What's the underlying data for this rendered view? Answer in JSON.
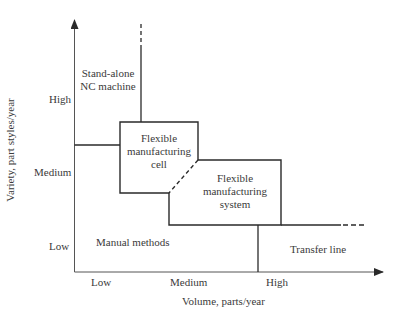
{
  "diagram": {
    "axes": {
      "x_label": "Volume, parts/year",
      "y_label": "Variety, part styles/year",
      "x_ticks": [
        "Low",
        "Medium",
        "High"
      ],
      "y_ticks": [
        "High",
        "Medium",
        "Low"
      ]
    },
    "regions": {
      "stand_alone": [
        "Stand-alone",
        "NC machine"
      ],
      "fmc": [
        "Flexible",
        "manufacturing",
        "cell"
      ],
      "fms": [
        "Flexible",
        "manufacturing",
        "system"
      ],
      "manual": "Manual methods",
      "transfer": "Transfer line"
    },
    "colors": {
      "line": "#2a2a2a",
      "text": "#3a3a3a"
    }
  }
}
